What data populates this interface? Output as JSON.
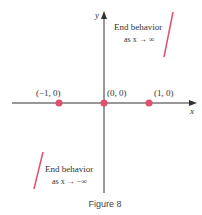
{
  "figure": {
    "caption": "Figure 8",
    "axes": {
      "x_label": "x",
      "y_label": "y"
    },
    "points": [
      {
        "label": "(−1, 0)",
        "x": -1,
        "y": 0
      },
      {
        "label": "(0, 0)",
        "x": 0,
        "y": 0
      },
      {
        "label": "(1, 0)",
        "x": 1,
        "y": 0
      }
    ],
    "annotations": {
      "right": {
        "line1": "End behavior",
        "line2": "as x → ∞"
      },
      "left": {
        "line1": "End behavior",
        "line2": "as x → −∞"
      }
    },
    "colors": {
      "accent": "#e0506e",
      "axis": "#333333"
    }
  }
}
